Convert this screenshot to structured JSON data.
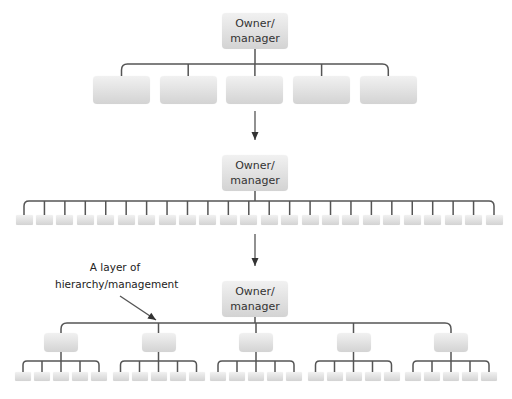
{
  "diagram": {
    "type": "organization-structure-comparison",
    "colors": {
      "line": "#555555",
      "box_top": "#f1f1f1",
      "box_bottom": "#d3d3d3",
      "text": "#333333"
    },
    "panels": [
      {
        "name": "flat-five",
        "top_label": "Owner/manager",
        "top_label_lines": [
          "Owner/",
          "manager"
        ],
        "subordinate_count": 5
      },
      {
        "name": "flat-wide",
        "top_label": "Owner/manager",
        "top_label_lines": [
          "Owner/",
          "manager"
        ],
        "subordinate_count": 24
      },
      {
        "name": "hierarchical",
        "top_label": "Owner/manager",
        "top_label_lines": [
          "Owner/",
          "manager"
        ],
        "middle_manager_count": 5,
        "subordinates_per_manager": 5
      }
    ],
    "annotation": {
      "lines": [
        "A layer of",
        "hierarchy/management"
      ]
    }
  }
}
